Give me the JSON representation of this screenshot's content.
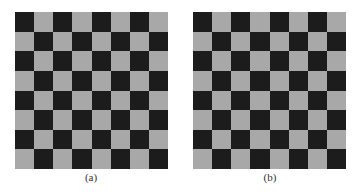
{
  "figure": {
    "panels": [
      {
        "id": "a",
        "caption": "(a)",
        "rows": 8,
        "cols": 8,
        "top_left": "dark"
      },
      {
        "id": "b",
        "caption": "(b)",
        "rows": 8,
        "cols": 8,
        "top_left": "dark"
      }
    ],
    "colors": {
      "dark": "#1c1c1c",
      "light": "#a8a8a8"
    }
  }
}
